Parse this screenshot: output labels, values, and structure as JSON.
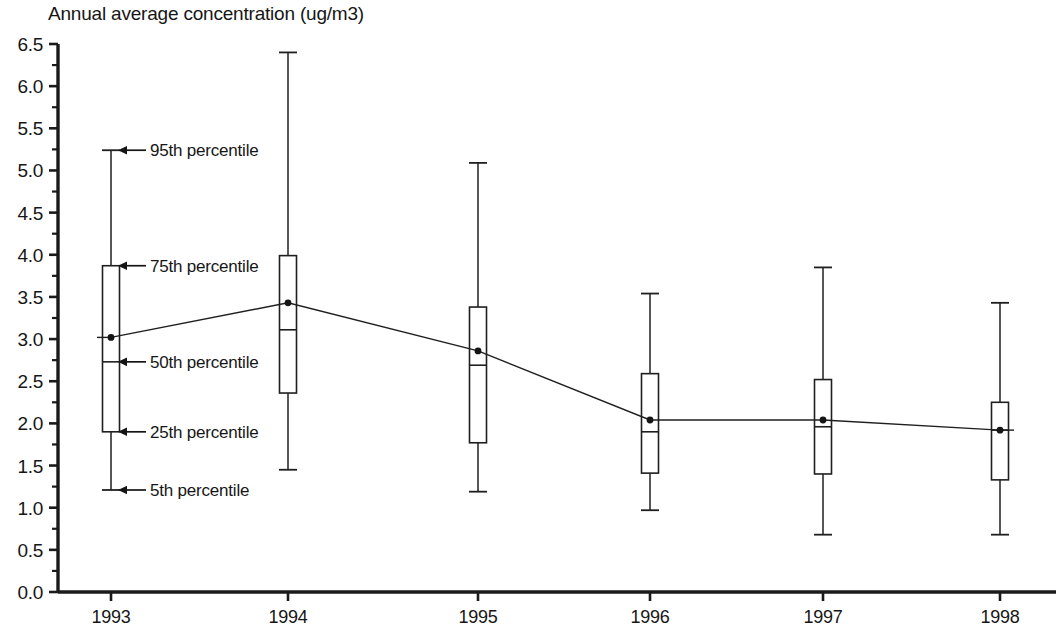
{
  "chart_data": {
    "type": "box",
    "title": "Annual average concentration (ug/m3)",
    "xlabel": "",
    "ylabel": "",
    "ylim": [
      0.0,
      6.5
    ],
    "ytick_step": 0.5,
    "yminor_step": 0.25,
    "grid": false,
    "legend": "none",
    "categories": [
      "1993",
      "1994",
      "1995",
      "1996",
      "1997",
      "1998"
    ],
    "ytick_labels": [
      "0.0",
      "0.5",
      "1.0",
      "1.5",
      "2.0",
      "2.5",
      "3.0",
      "3.5",
      "4.0",
      "4.5",
      "5.0",
      "5.5",
      "6.0",
      "6.5"
    ],
    "series": [
      {
        "name": "Annual average concentration",
        "boxes": [
          {
            "category": "1993",
            "p5": 1.21,
            "p25": 1.9,
            "p50": 2.73,
            "p75": 3.87,
            "p95": 5.24,
            "mean": 3.02
          },
          {
            "category": "1994",
            "p5": 1.45,
            "p25": 2.36,
            "p50": 3.11,
            "p75": 3.99,
            "p95": 6.4,
            "mean": 3.43
          },
          {
            "category": "1995",
            "p5": 1.19,
            "p25": 1.77,
            "p50": 2.69,
            "p75": 3.38,
            "p95": 5.09,
            "mean": 2.86
          },
          {
            "category": "1996",
            "p5": 0.97,
            "p25": 1.41,
            "p50": 1.9,
            "p75": 2.59,
            "p95": 3.54,
            "mean": 2.04
          },
          {
            "category": "1997",
            "p5": 0.68,
            "p25": 1.4,
            "p50": 1.96,
            "p75": 2.52,
            "p95": 3.85,
            "mean": 2.04
          },
          {
            "category": "1998",
            "p5": 0.68,
            "p25": 1.33,
            "p50": 1.92,
            "p75": 2.25,
            "p95": 3.43,
            "mean": 1.92
          }
        ]
      }
    ],
    "mean_line": {
      "name": "mean connector",
      "values": [
        3.02,
        3.43,
        2.86,
        2.04,
        2.04,
        1.92
      ]
    },
    "annotations": [
      {
        "id": "p95",
        "label": "95th percentile",
        "target_value": 5.24
      },
      {
        "id": "p75",
        "label": "75th percentile",
        "target_value": 3.87
      },
      {
        "id": "p50",
        "label": "50th percentile",
        "target_value": 2.73
      },
      {
        "id": "p25",
        "label": "25th percentile",
        "target_value": 1.9
      },
      {
        "id": "p5",
        "label": "5th percentile",
        "target_value": 1.21
      }
    ],
    "colors": {
      "axis": "#1a1a1a",
      "line": "#1f1f1f",
      "box_fill": "#ffffff",
      "text": "#161616"
    }
  }
}
